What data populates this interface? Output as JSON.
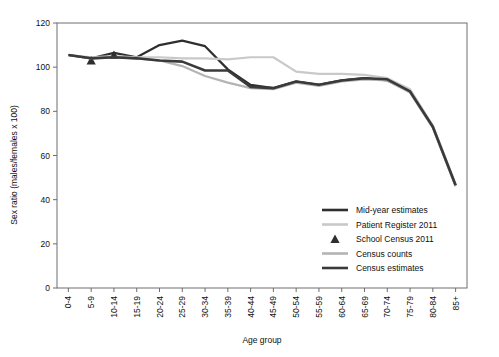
{
  "chart_data": {
    "type": "line",
    "title": "",
    "xlabel": "Age group",
    "ylabel": "Sex ratio (males/females x 100)",
    "ylim": [
      0,
      120
    ],
    "yticks": [
      0,
      20,
      40,
      60,
      80,
      100,
      120
    ],
    "grid": false,
    "legend_position": "inside-bottom-right",
    "categories": [
      "0-4",
      "5-9",
      "10-14",
      "15-19",
      "20-24",
      "25-29",
      "30-34",
      "35-39",
      "40-44",
      "45-49",
      "50-54",
      "55-59",
      "60-64",
      "65-69",
      "70-74",
      "75-79",
      "80-84",
      "85+"
    ],
    "series": [
      {
        "name": "Mid-year estimates",
        "style": "line",
        "color": "#2f2f2f",
        "width": 2.2,
        "values": [
          105.5,
          104.0,
          106.5,
          104.5,
          110.0,
          112.0,
          109.5,
          99.0,
          92.0,
          90.5,
          93.5,
          92.0,
          94.0,
          95.0,
          94.0,
          89.0,
          73.0,
          46.5
        ]
      },
      {
        "name": "Patient Register 2011",
        "style": "line",
        "color": "#c9c9c9",
        "width": 2.2,
        "values": [
          105.5,
          104.5,
          105.0,
          104.5,
          104.5,
          104.0,
          104.0,
          103.5,
          104.5,
          104.5,
          98.0,
          97.0,
          97.0,
          96.5,
          95.0,
          90.0,
          73.5,
          47.0
        ]
      },
      {
        "name": "School Census 2011",
        "style": "marker",
        "marker": "triangle",
        "color": "#2f2f2f",
        "values": [
          null,
          103.0,
          105.5,
          null,
          null,
          null,
          null,
          null,
          null,
          null,
          null,
          null,
          null,
          null,
          null,
          null,
          null,
          null
        ]
      },
      {
        "name": "Census counts",
        "style": "line",
        "color": "#b4b4b4",
        "width": 2.2,
        "values": [
          105.5,
          104.0,
          104.5,
          104.0,
          103.0,
          100.5,
          96.0,
          93.0,
          90.5,
          90.0,
          93.0,
          91.5,
          93.5,
          94.5,
          94.0,
          88.5,
          72.5,
          46.0
        ]
      },
      {
        "name": "Census estimates",
        "style": "line",
        "color": "#3a3a3a",
        "width": 2.6,
        "values": [
          105.5,
          104.0,
          104.5,
          104.0,
          103.0,
          102.5,
          98.5,
          98.5,
          91.0,
          90.5,
          93.5,
          92.0,
          94.0,
          95.0,
          94.5,
          89.0,
          73.0,
          46.5
        ]
      }
    ]
  },
  "axes": {
    "y_title": "Sex ratio (males/females x 100)",
    "x_title": "Age group",
    "y_tick_labels": [
      "0",
      "20",
      "40",
      "60",
      "80",
      "100",
      "120"
    ],
    "x_tick_labels": [
      "0-4",
      "5-9",
      "10-14",
      "15-19",
      "20-24",
      "25-29",
      "30-34",
      "35-39",
      "40-44",
      "45-49",
      "50-54",
      "55-59",
      "60-64",
      "65-69",
      "70-74",
      "75-79",
      "80-84",
      "85+"
    ]
  },
  "legend": {
    "items": [
      {
        "label": "Mid-year estimates",
        "swatch": "line",
        "color": "#2f2f2f"
      },
      {
        "label": "Patient Register 2011",
        "swatch": "line",
        "color": "#c9c9c9"
      },
      {
        "label": "School Census 2011",
        "swatch": "triangle",
        "color": "#2f2f2f"
      },
      {
        "label": "Census counts",
        "swatch": "line",
        "color": "#b4b4b4"
      },
      {
        "label": "Census estimates",
        "swatch": "line",
        "color": "#3a3a3a"
      }
    ]
  }
}
